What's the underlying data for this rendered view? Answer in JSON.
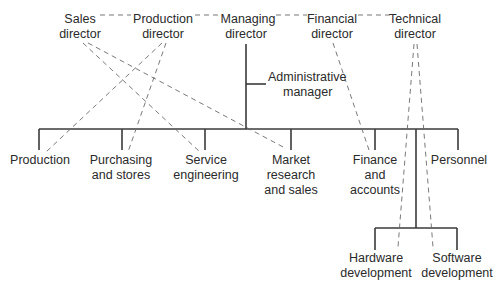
{
  "diagram": {
    "type": "organization-chart",
    "directors": [
      {
        "id": "sales",
        "line1": "Sales",
        "line2": "director"
      },
      {
        "id": "production",
        "line1": "Production",
        "line2": "director"
      },
      {
        "id": "managing",
        "line1": "Managing",
        "line2": "director"
      },
      {
        "id": "financial",
        "line1": "Financial",
        "line2": "director"
      },
      {
        "id": "technical",
        "line1": "Technical",
        "line2": "director"
      }
    ],
    "staff": {
      "id": "admin",
      "line1": "Administrative",
      "line2": "manager"
    },
    "departments": [
      {
        "id": "production-dept",
        "lines": [
          "Production"
        ]
      },
      {
        "id": "purchasing",
        "lines": [
          "Purchasing",
          "and stores"
        ]
      },
      {
        "id": "service",
        "lines": [
          "Service",
          "engineering"
        ]
      },
      {
        "id": "market",
        "lines": [
          "Market",
          "research",
          "and sales"
        ]
      },
      {
        "id": "finance",
        "lines": [
          "Finance",
          "and",
          "accounts"
        ]
      },
      {
        "id": "personnel",
        "lines": [
          "Personnel"
        ]
      }
    ],
    "sub_departments": [
      {
        "id": "hardware",
        "lines": [
          "Hardware",
          "development"
        ]
      },
      {
        "id": "software",
        "lines": [
          "Software",
          "development"
        ]
      }
    ],
    "functional_links": [
      {
        "from": "Sales director",
        "to": "Service engineering"
      },
      {
        "from": "Sales director",
        "to": "Market research and sales"
      },
      {
        "from": "Production director",
        "to": "Production"
      },
      {
        "from": "Production director",
        "to": "Purchasing and stores"
      },
      {
        "from": "Financial director",
        "to": "Finance and accounts"
      },
      {
        "from": "Technical director",
        "to": "Hardware development"
      },
      {
        "from": "Technical director",
        "to": "Software development"
      }
    ],
    "colors": {
      "line": "#3a3a3a",
      "dashed": "#6a6a6a",
      "text": "#2a2a2a",
      "background": "#ffffff"
    }
  }
}
